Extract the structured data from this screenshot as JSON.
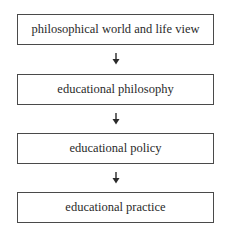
{
  "diagram": {
    "type": "vertical flowchart",
    "nodes": [
      {
        "id": "n1",
        "label": "philosophical world and life view"
      },
      {
        "id": "n2",
        "label": "educational philosophy"
      },
      {
        "id": "n3",
        "label": "educational policy"
      },
      {
        "id": "n4",
        "label": "educational practice"
      }
    ],
    "edges": [
      {
        "from": "n1",
        "to": "n2",
        "icon": "arrow-down-icon"
      },
      {
        "from": "n2",
        "to": "n3",
        "icon": "arrow-down-icon"
      },
      {
        "from": "n3",
        "to": "n4",
        "icon": "arrow-down-icon"
      }
    ],
    "colors": {
      "border": "#4a4a4a",
      "text": "#2a2a2a",
      "background": "#ffffff"
    }
  }
}
